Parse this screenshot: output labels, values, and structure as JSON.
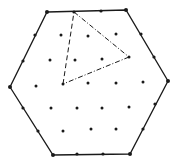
{
  "figure": {
    "colors": {
      "background": "#ffffff",
      "ink": "#1a1a1a"
    },
    "hexagon": {
      "vertices": [
        [
          47,
          12
        ],
        [
          126,
          10
        ],
        [
          168,
          81
        ],
        [
          130,
          154
        ],
        [
          53,
          155
        ],
        [
          10,
          87
        ]
      ]
    },
    "edge_points": [
      [
        74,
        12
      ],
      [
        101,
        11
      ],
      [
        141,
        34
      ],
      [
        154,
        57
      ],
      [
        155,
        104
      ],
      [
        143,
        129
      ],
      [
        103,
        154
      ],
      [
        77,
        154
      ],
      [
        38,
        131
      ],
      [
        23,
        108
      ],
      [
        23,
        61
      ],
      [
        35,
        35
      ]
    ],
    "interior_points": [
      [
        61,
        35
      ],
      [
        88,
        36
      ],
      [
        116,
        34
      ],
      [
        50,
        60
      ],
      [
        75,
        60
      ],
      [
        102,
        59
      ],
      [
        129,
        57
      ],
      [
        36,
        86
      ],
      [
        63,
        84
      ],
      [
        88,
        83
      ],
      [
        116,
        83
      ],
      [
        143,
        82
      ],
      [
        51,
        108
      ],
      [
        77,
        108
      ],
      [
        102,
        108
      ],
      [
        129,
        107
      ],
      [
        63,
        131
      ],
      [
        91,
        129
      ],
      [
        116,
        129
      ]
    ],
    "triangle": {
      "vertices": [
        [
          74,
          12
        ],
        [
          129,
          57
        ],
        [
          63,
          84
        ]
      ],
      "edges": [
        {
          "from": 0,
          "to": 1,
          "style": "dash-dot"
        },
        {
          "from": 1,
          "to": 2,
          "style": "dash-dot"
        },
        {
          "from": 2,
          "to": 0,
          "style": "dashed"
        }
      ]
    }
  }
}
